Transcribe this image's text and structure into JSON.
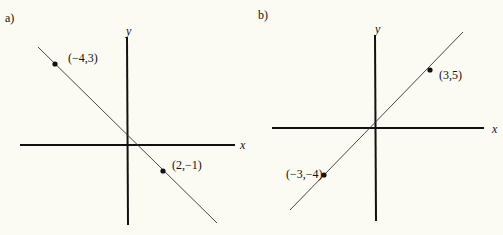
{
  "panels": [
    {
      "label": "a)",
      "x_axis_label": "x",
      "y_axis_label": "y",
      "points": [
        {
          "label": "(−4,3)",
          "x": -4,
          "y": 3
        },
        {
          "label": "(2,−1)",
          "x": 2,
          "y": -1
        }
      ]
    },
    {
      "label": "b)",
      "x_axis_label": "x",
      "y_axis_label": "y",
      "points": [
        {
          "label": "(3,5)",
          "x": 3,
          "y": 5
        },
        {
          "label": "(−3,−4)",
          "x": -3,
          "y": -4
        }
      ]
    }
  ],
  "colors": {
    "background": "#fbfaf3",
    "ink": "#111111",
    "line": "#333333"
  }
}
